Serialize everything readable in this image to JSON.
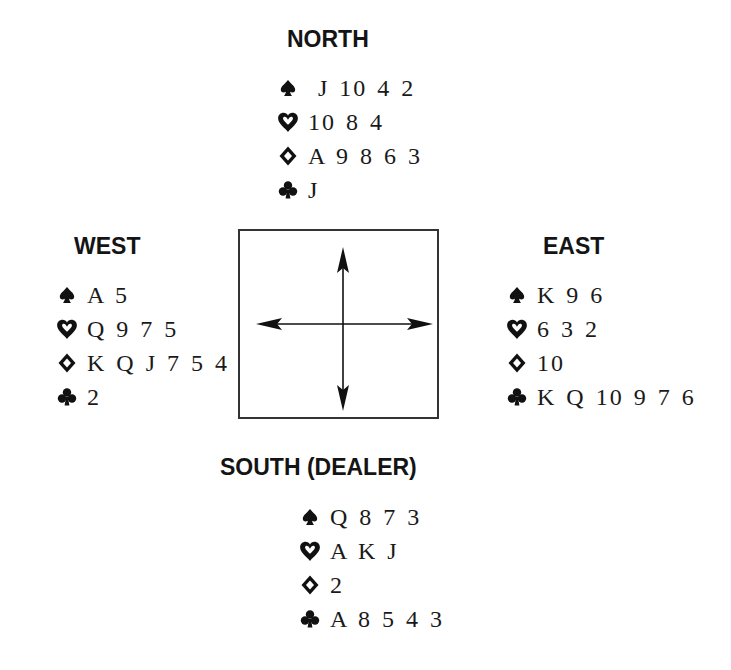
{
  "north": {
    "title": "NORTH",
    "spades": "J 10 4 2",
    "hearts": "10 8 4",
    "diamonds": "A 9 8 6 3",
    "clubs": "J"
  },
  "west": {
    "title": "WEST",
    "spades": "A 5",
    "hearts": "Q 9 7 5",
    "diamonds": "K Q J 7 5 4",
    "clubs": "2"
  },
  "east": {
    "title": "EAST",
    "spades": "K 9 6",
    "hearts": "6 3 2",
    "diamonds": "10",
    "clubs": "K Q 10 9 7 6"
  },
  "south": {
    "title": "SOUTH (DEALER)",
    "spades": "Q 8 7 3",
    "hearts": "A K J",
    "diamonds": "2",
    "clubs": "A 8 5 4 3"
  },
  "icons": {
    "spades": "spade-icon",
    "hearts": "heart-outline-icon",
    "diamonds": "diamond-outline-icon",
    "clubs": "club-icon"
  },
  "colors": {
    "ink": "#111111",
    "background": "#ffffff"
  }
}
